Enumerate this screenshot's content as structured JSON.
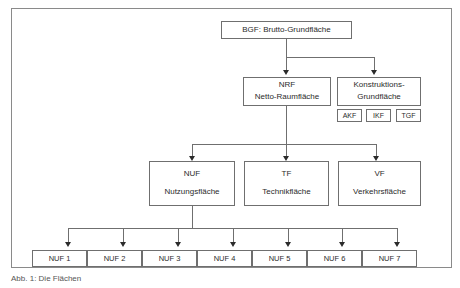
{
  "figure": {
    "caption": "Abb. 1: Die Flächen",
    "frame_color": "#8a8a8a",
    "box_border_color": "#6f6f6f",
    "text_color": "#2b2b2b"
  },
  "levels": {
    "root": {
      "label": "BGF: Brutto-Grundfläche"
    },
    "level2": [
      {
        "code": "NRF",
        "name": "Netto-Raumfläche"
      },
      {
        "code": "Konstruktions-",
        "name": "Grundfläche"
      }
    ],
    "construction_tags": [
      {
        "label": "AKF"
      },
      {
        "label": "IKF"
      },
      {
        "label": "TGF"
      }
    ],
    "level3": [
      {
        "code": "NUF",
        "name": "Nutzungsfläche"
      },
      {
        "code": "TF",
        "name": "Technikfläche"
      },
      {
        "code": "VF",
        "name": "Verkehrsfläche"
      }
    ],
    "leaves": [
      {
        "label": "NUF 1"
      },
      {
        "label": "NUF 2"
      },
      {
        "label": "NUF 3"
      },
      {
        "label": "NUF 4"
      },
      {
        "label": "NUF 5"
      },
      {
        "label": "NUF 6"
      },
      {
        "label": "NUF 7"
      }
    ]
  }
}
